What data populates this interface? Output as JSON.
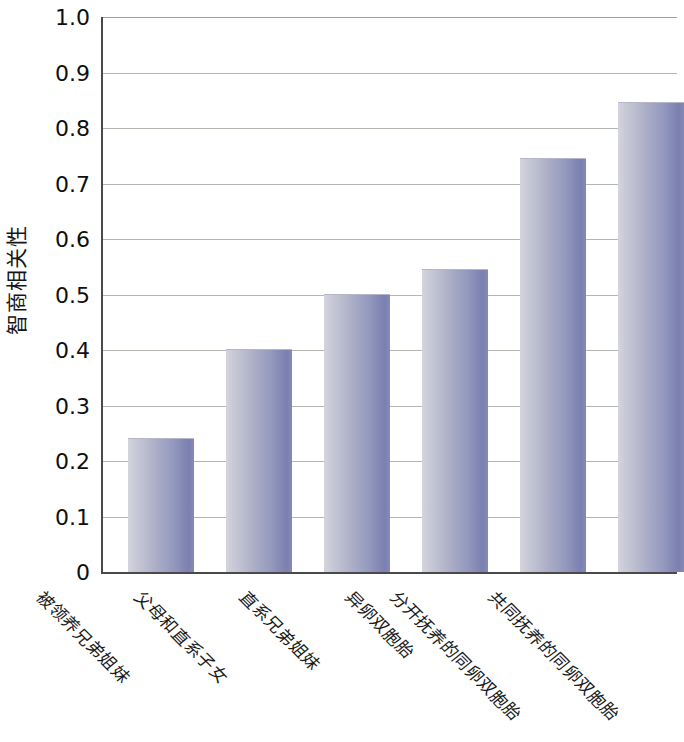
{
  "chart_data": {
    "type": "bar",
    "title": "",
    "xlabel": "",
    "ylabel": "智商相关性",
    "ylim": [
      0,
      1.0
    ],
    "grid": true,
    "legend": "none",
    "orientation": "vertical",
    "y_ticks": [
      "1.0",
      "0.9",
      "0.8",
      "0.7",
      "0.6",
      "0.5",
      "0.4",
      "0.3",
      "0.2",
      "0.1",
      "0"
    ],
    "y_tick_values": [
      1.0,
      0.9,
      0.8,
      0.7,
      0.6,
      0.5,
      0.4,
      0.3,
      0.2,
      0.1,
      0
    ],
    "categories": [
      "被领养兄弟姐妹",
      "父母和直系子女",
      "直系兄弟姐妹",
      "异卵双胞胎",
      "分开抚养的同卵双胞胎",
      "共同抚养的同卵双胞胎"
    ],
    "values": [
      0.24,
      0.4,
      0.5,
      0.545,
      0.745,
      0.845
    ],
    "bar_color_light": "#d4d4dd",
    "bar_color_dark": "#7a80b0",
    "grid_color": "#a7a9a2",
    "axis_color": "#4a4a4a"
  },
  "axis": {
    "y_title": "智商相关性"
  }
}
